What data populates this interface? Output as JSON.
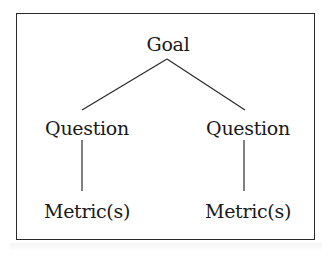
{
  "diagram": {
    "type": "hierarchy",
    "root": {
      "label": "Goal"
    },
    "questions": [
      {
        "label": "Question"
      },
      {
        "label": "Question"
      }
    ],
    "metrics": [
      {
        "label": "Metric(s)"
      },
      {
        "label": "Metric(s)"
      }
    ],
    "edges": [
      {
        "from": "Goal",
        "to": "Question (left)"
      },
      {
        "from": "Goal",
        "to": "Question (right)"
      },
      {
        "from": "Question (left)",
        "to": "Metric(s) (left)"
      },
      {
        "from": "Question (right)",
        "to": "Metric(s) (right)"
      }
    ],
    "colors": {
      "background": "#ffffff",
      "stroke": "#2a2a2a",
      "text": "#1a1a1a"
    }
  }
}
